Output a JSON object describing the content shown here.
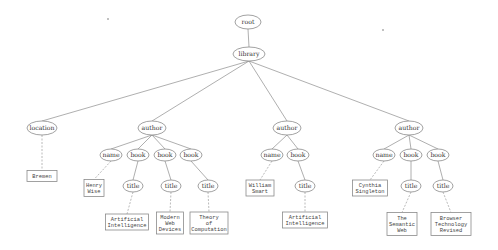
{
  "diagram": {
    "type": "xml-tree",
    "element_nodes": [
      {
        "id": "root",
        "label": "root",
        "x": 248,
        "y": 22,
        "rx": 13,
        "ry": 7
      },
      {
        "id": "library",
        "label": "library",
        "x": 249,
        "y": 54,
        "rx": 16,
        "ry": 7
      },
      {
        "id": "location",
        "label": "location",
        "x": 42,
        "y": 128,
        "rx": 15,
        "ry": 7
      },
      {
        "id": "author1",
        "label": "author",
        "x": 152,
        "y": 128,
        "rx": 14,
        "ry": 7
      },
      {
        "id": "author2",
        "label": "author",
        "x": 287,
        "y": 128,
        "rx": 14,
        "ry": 7
      },
      {
        "id": "author3",
        "label": "author",
        "x": 409,
        "y": 128,
        "rx": 14,
        "ry": 7
      },
      {
        "id": "a1_name",
        "label": "name",
        "x": 111,
        "y": 155,
        "rx": 11,
        "ry": 6
      },
      {
        "id": "a1_book1",
        "label": "book",
        "x": 138,
        "y": 155,
        "rx": 11,
        "ry": 6
      },
      {
        "id": "a1_book2",
        "label": "book",
        "x": 165,
        "y": 155,
        "rx": 11,
        "ry": 6
      },
      {
        "id": "a1_book3",
        "label": "book",
        "x": 191,
        "y": 155,
        "rx": 11,
        "ry": 6
      },
      {
        "id": "a1_title1",
        "label": "title",
        "x": 133,
        "y": 186,
        "rx": 10,
        "ry": 6
      },
      {
        "id": "a1_title2",
        "label": "title",
        "x": 171,
        "y": 186,
        "rx": 10,
        "ry": 6
      },
      {
        "id": "a1_title3",
        "label": "title",
        "x": 208,
        "y": 186,
        "rx": 10,
        "ry": 6
      },
      {
        "id": "a2_name",
        "label": "name",
        "x": 272,
        "y": 155,
        "rx": 11,
        "ry": 6
      },
      {
        "id": "a2_book",
        "label": "book",
        "x": 298,
        "y": 155,
        "rx": 11,
        "ry": 6
      },
      {
        "id": "a2_title",
        "label": "title",
        "x": 305,
        "y": 186,
        "rx": 10,
        "ry": 6
      },
      {
        "id": "a3_name",
        "label": "name",
        "x": 384,
        "y": 155,
        "rx": 11,
        "ry": 6
      },
      {
        "id": "a3_book1",
        "label": "book",
        "x": 411,
        "y": 155,
        "rx": 11,
        "ry": 6
      },
      {
        "id": "a3_book2",
        "label": "book",
        "x": 438,
        "y": 155,
        "rx": 11,
        "ry": 6
      },
      {
        "id": "a3_title1",
        "label": "title",
        "x": 411,
        "y": 186,
        "rx": 10,
        "ry": 6
      },
      {
        "id": "a3_title2",
        "label": "title",
        "x": 443,
        "y": 186,
        "rx": 10,
        "ry": 6
      }
    ],
    "value_nodes": [
      {
        "id": "v_location",
        "lines": [
          "Bremen"
        ],
        "x": 42,
        "y": 176,
        "w": 30,
        "h": 11
      },
      {
        "id": "v_a1_name",
        "lines": [
          "Henry",
          "Wise"
        ],
        "x": 94,
        "y": 188,
        "w": 20,
        "h": 17
      },
      {
        "id": "v_a1_title1",
        "lines": [
          "Artificial",
          "Intelligence"
        ],
        "x": 127,
        "y": 222,
        "w": 43,
        "h": 16
      },
      {
        "id": "v_a1_title2",
        "lines": [
          "Modern",
          "Web",
          "Devices"
        ],
        "x": 170,
        "y": 223,
        "w": 27,
        "h": 22
      },
      {
        "id": "v_a1_title3",
        "lines": [
          "Theory",
          "of",
          "Computation"
        ],
        "x": 209,
        "y": 223,
        "w": 38,
        "h": 22
      },
      {
        "id": "v_a2_name",
        "lines": [
          "William",
          "Smart"
        ],
        "x": 260,
        "y": 188,
        "w": 28,
        "h": 16
      },
      {
        "id": "v_a2_title",
        "lines": [
          "Artificial",
          "Intelligence"
        ],
        "x": 305,
        "y": 220,
        "w": 45,
        "h": 16
      },
      {
        "id": "v_a3_name",
        "lines": [
          "Cynthia",
          "Singleton"
        ],
        "x": 370,
        "y": 188,
        "w": 35,
        "h": 16
      },
      {
        "id": "v_a3_title1",
        "lines": [
          "The",
          "Semantic",
          "Web"
        ],
        "x": 402,
        "y": 224,
        "w": 30,
        "h": 23
      },
      {
        "id": "v_a3_title2",
        "lines": [
          "Browser",
          "Technology",
          "Revised"
        ],
        "x": 451,
        "y": 224,
        "w": 40,
        "h": 23
      }
    ],
    "edges": [
      [
        "root",
        "library",
        "solid"
      ],
      [
        "library",
        "location",
        "solid"
      ],
      [
        "library",
        "author1",
        "solid"
      ],
      [
        "library",
        "author2",
        "solid"
      ],
      [
        "library",
        "author3",
        "solid"
      ],
      [
        "author1",
        "a1_name",
        "solid"
      ],
      [
        "author1",
        "a1_book1",
        "solid"
      ],
      [
        "author1",
        "a1_book2",
        "solid"
      ],
      [
        "author1",
        "a1_book3",
        "solid"
      ],
      [
        "a1_book1",
        "a1_title1",
        "solid"
      ],
      [
        "a1_book2",
        "a1_title2",
        "solid"
      ],
      [
        "a1_book3",
        "a1_title3",
        "solid"
      ],
      [
        "author2",
        "a2_name",
        "solid"
      ],
      [
        "author2",
        "a2_book",
        "solid"
      ],
      [
        "a2_book",
        "a2_title",
        "solid"
      ],
      [
        "author3",
        "a3_name",
        "solid"
      ],
      [
        "author3",
        "a3_book1",
        "solid"
      ],
      [
        "author3",
        "a3_book2",
        "solid"
      ],
      [
        "a3_book1",
        "a3_title1",
        "solid"
      ],
      [
        "a3_book2",
        "a3_title2",
        "solid"
      ],
      [
        "location",
        "v_location",
        "dashed"
      ],
      [
        "a1_name",
        "v_a1_name",
        "dashed"
      ],
      [
        "a1_title1",
        "v_a1_title1",
        "dashed"
      ],
      [
        "a1_title2",
        "v_a1_title2",
        "dashed"
      ],
      [
        "a1_title3",
        "v_a1_title3",
        "dashed"
      ],
      [
        "a2_name",
        "v_a2_name",
        "dashed"
      ],
      [
        "a2_title",
        "v_a2_title",
        "dashed"
      ],
      [
        "a3_name",
        "v_a3_name",
        "dashed"
      ],
      [
        "a3_title1",
        "v_a3_title1",
        "dashed"
      ],
      [
        "a3_title2",
        "v_a3_title2",
        "dashed"
      ]
    ],
    "specks": [
      {
        "x": 108,
        "y": 19
      },
      {
        "x": 383,
        "y": 30
      }
    ]
  }
}
